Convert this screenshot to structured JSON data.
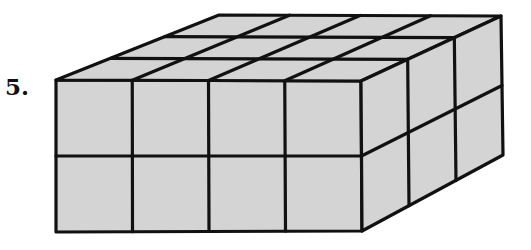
{
  "problem": {
    "number_label": "5."
  },
  "figure": {
    "dimensions": {
      "length": 4,
      "width": 3,
      "height": 2
    },
    "fill_color": "#d4d4d4",
    "stroke_color": "#111111",
    "stroke_width": 3.2,
    "vertices": {
      "front_top_left": [
        56,
        80
      ],
      "front_top_right": [
        361,
        81
      ],
      "front_bottom_left": [
        56,
        232
      ],
      "front_bottom_right": [
        362,
        231
      ],
      "back_top_left": [
        219,
        15
      ],
      "back_top_right": [
        501,
        16
      ],
      "back_bottom_right": [
        503,
        155
      ]
    }
  }
}
